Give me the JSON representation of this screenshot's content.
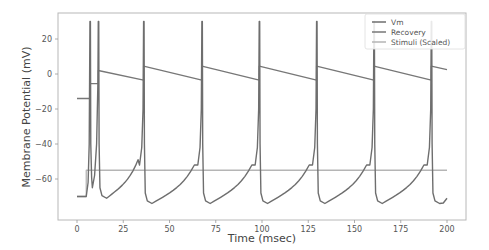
{
  "chart_data": {
    "type": "line",
    "title": "",
    "xlabel": "Time (msec)",
    "ylabel": "Membrane Potential (mV)",
    "xlim": [
      -10,
      210
    ],
    "ylim": [
      -78,
      35
    ],
    "xticks": [
      0,
      25,
      50,
      75,
      100,
      125,
      150,
      175,
      200
    ],
    "yticks": [
      -60,
      -40,
      -20,
      0,
      20
    ],
    "grid": false,
    "legend_position": "upper right",
    "series": [
      {
        "name": "Vm",
        "color": "#6e6e6e",
        "description": "Izhikevich-style spiking membrane potential; rests at -70 mV until stimulus onset at ~5 ms, then fires spikes peaking at 30 mV",
        "spike_times": [
          7,
          11.5,
          36,
          67.5,
          98.5,
          129.5,
          160.5,
          191.5
        ],
        "spike_peak": 30,
        "trough_values": [
          -65,
          -71,
          -74,
          -74,
          -74,
          -74,
          -74,
          -74
        ],
        "resting": -70
      },
      {
        "name": "Recovery",
        "color": "#777777",
        "description": "Recovery variable; -14 until first spike, steps up after each spike then decays linearly",
        "points": [
          [
            0,
            -14
          ],
          [
            7,
            -14
          ],
          [
            7,
            -5.5
          ],
          [
            11.5,
            -5.5
          ],
          [
            11.5,
            2
          ],
          [
            36,
            -3.5
          ],
          [
            36,
            4.5
          ],
          [
            67.5,
            -3.5
          ],
          [
            67.5,
            4.5
          ],
          [
            98.5,
            -3.5
          ],
          [
            98.5,
            4.5
          ],
          [
            129.5,
            -3.5
          ],
          [
            129.5,
            4.5
          ],
          [
            160.5,
            -3.5
          ],
          [
            160.5,
            4.5
          ],
          [
            191.5,
            -3.5
          ],
          [
            191.5,
            4.5
          ],
          [
            200,
            2.5
          ]
        ]
      },
      {
        "name": "Stimuli (Scaled)",
        "color": "#b5b5b5",
        "points": [
          [
            0,
            -70
          ],
          [
            5,
            -70
          ],
          [
            5,
            -55
          ],
          [
            200,
            -55
          ]
        ]
      }
    ]
  },
  "legend": {
    "items": [
      {
        "label": "Vm"
      },
      {
        "label": "Recovery"
      },
      {
        "label": "Stimuli (Scaled)"
      }
    ]
  },
  "axes": {
    "xlabel": "Time (msec)",
    "ylabel": "Membrane Potential (mV)",
    "xtick_labels": [
      "0",
      "25",
      "50",
      "75",
      "100",
      "125",
      "150",
      "175",
      "200"
    ],
    "ytick_labels": [
      "20",
      "0",
      "−20",
      "−40",
      "−60"
    ]
  }
}
